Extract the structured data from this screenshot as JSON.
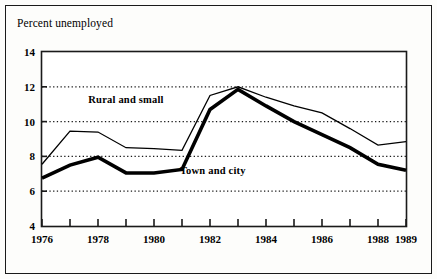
{
  "chart_data": {
    "type": "line",
    "title": "Percent unemployed",
    "xlabel": "",
    "ylabel": "",
    "grid": "horizontal-dotted",
    "legend_position": "inline-annotations",
    "x": [
      1976,
      1977,
      1978,
      1979,
      1980,
      1981,
      1982,
      1983,
      1984,
      1985,
      1986,
      1987,
      1988,
      1989
    ],
    "xlim": [
      1976,
      1989
    ],
    "ylim": [
      4,
      14
    ],
    "yticks": [
      4,
      6,
      8,
      10,
      12,
      14
    ],
    "ytick_labels": [
      "4",
      "6",
      "8",
      "10",
      "12",
      "14"
    ],
    "xticks": [
      1976,
      1977,
      1978,
      1979,
      1980,
      1981,
      1982,
      1983,
      1984,
      1985,
      1986,
      1987,
      1988,
      1989
    ],
    "xtick_labels_shown": [
      {
        "x": 1976,
        "label": "1976"
      },
      {
        "x": 1978,
        "label": "1978"
      },
      {
        "x": 1980,
        "label": "1980"
      },
      {
        "x": 1982,
        "label": "1982"
      },
      {
        "x": 1984,
        "label": "1984"
      },
      {
        "x": 1986,
        "label": "1986"
      },
      {
        "x": 1988,
        "label": "1988"
      },
      {
        "x": 1989,
        "label": "1989"
      }
    ],
    "series": [
      {
        "name": "Rural and small",
        "style": "thin",
        "color": "#000000",
        "values": [
          7.55,
          9.45,
          9.4,
          8.5,
          8.45,
          8.35,
          11.5,
          12.0,
          11.4,
          10.9,
          10.5,
          9.6,
          8.65,
          8.85
        ]
      },
      {
        "name": "Town and city",
        "style": "thick",
        "color": "#000000",
        "values": [
          6.75,
          7.5,
          7.95,
          7.05,
          7.05,
          7.25,
          10.7,
          11.85,
          10.9,
          10.0,
          9.25,
          8.5,
          7.55,
          7.2
        ]
      }
    ],
    "annotations": [
      {
        "text": "Rural and small",
        "x": 1979.0,
        "y": 11.05
      },
      {
        "text": "Town and city",
        "x": 1982.1,
        "y": 7.0
      }
    ]
  },
  "axes": {
    "y_axis_name": "percent-unemployed-axis",
    "x_axis_name": "year-axis"
  }
}
